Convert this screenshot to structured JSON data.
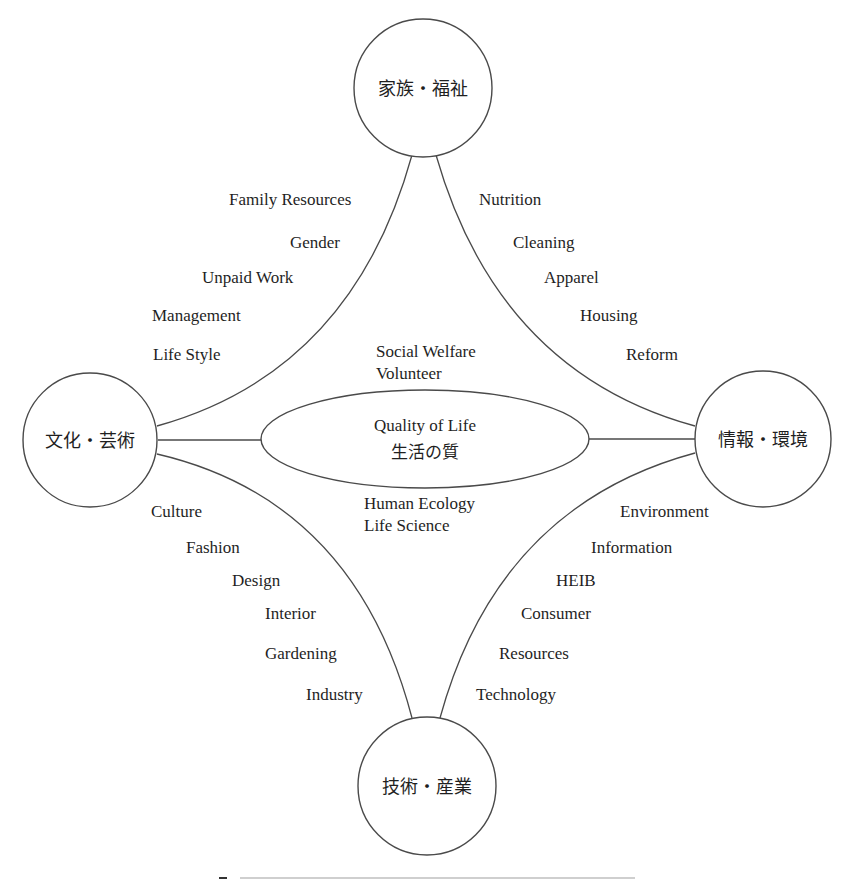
{
  "diagram": {
    "center": {
      "line1": "Quality of Life",
      "line2": "生活の質",
      "above": [
        "Social Welfare",
        "Volunteer"
      ],
      "below": [
        "Human Ecology",
        "Life Science"
      ]
    },
    "nodes": {
      "top": "家族・福祉",
      "left": "文化・芸術",
      "right": "情報・環境",
      "bottom": "技術・産業"
    },
    "branches": {
      "top_left": [
        "Family Resources",
        "Gender",
        "Unpaid Work",
        "Management",
        "Life Style"
      ],
      "top_right": [
        "Nutrition",
        "Cleaning",
        "Apparel",
        "Housing",
        "Reform"
      ],
      "bottom_left": [
        "Culture",
        "Fashion",
        "Design",
        "Interior",
        "Gardening",
        "Industry"
      ],
      "bottom_right": [
        "Environment",
        "Information",
        "HEIB",
        "Consumer",
        "Resources",
        "Technology"
      ]
    },
    "caption": "図"
  }
}
